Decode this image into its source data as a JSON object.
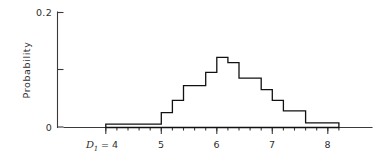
{
  "chart_data": {
    "type": "bar",
    "title": "",
    "subtitle": "",
    "xlabel": "D1",
    "ylabel": "Probability",
    "x_axis_prefix_label": "D1 = 4",
    "xlim": [
      3.9,
      8.45
    ],
    "ylim": [
      0,
      0.2
    ],
    "grid": false,
    "legend": null,
    "bin_width": 0.2,
    "x_tick_labels": [
      "4",
      "5",
      "6",
      "7",
      "8"
    ],
    "x_tick_values": [
      4,
      5,
      6,
      7,
      8
    ],
    "x_minor_tick_step": 0.2,
    "y_tick_labels": [
      "0",
      "0.2"
    ],
    "y_tick_values": [
      0,
      0.2
    ],
    "y_minor_tick_values": [
      0.1
    ],
    "categories": [
      "4.0-4.2",
      "4.2-4.4",
      "4.4-4.6",
      "4.6-4.8",
      "4.8-5.0",
      "5.0-5.2",
      "5.2-5.4",
      "5.4-5.6",
      "5.6-5.8",
      "5.8-6.0",
      "6.0-6.2",
      "6.2-6.4",
      "6.4-6.6",
      "6.6-6.8",
      "6.8-7.0",
      "7.0-7.2",
      "7.2-7.4",
      "7.4-7.6",
      "7.6-7.8",
      "7.8-8.0",
      "8.0-8.2"
    ],
    "bin_edges": [
      4.0,
      4.2,
      4.4,
      4.6,
      4.8,
      5.0,
      5.2,
      5.4,
      5.6,
      5.8,
      6.0,
      6.2,
      6.4,
      6.6,
      6.8,
      7.0,
      7.2,
      7.4,
      7.6,
      7.8,
      8.0,
      8.2
    ],
    "values": [
      0.006,
      0.006,
      0.006,
      0.006,
      0.006,
      0.026,
      0.047,
      0.073,
      0.073,
      0.096,
      0.122,
      0.113,
      0.086,
      0.086,
      0.066,
      0.047,
      0.029,
      0.029,
      0.008,
      0.008,
      0.008
    ],
    "series": [
      {
        "name": "Probability",
        "values": [
          0.006,
          0.006,
          0.006,
          0.006,
          0.006,
          0.026,
          0.047,
          0.073,
          0.073,
          0.096,
          0.122,
          0.113,
          0.086,
          0.086,
          0.066,
          0.047,
          0.029,
          0.029,
          0.008,
          0.008,
          0.008
        ]
      }
    ],
    "colors": {
      "bar_stroke": "#111111",
      "bar_fill": "#ffffff",
      "axis": "#3a3a3a",
      "text": "#2e2e2e",
      "background": "#ffffff"
    }
  },
  "axes": {
    "y_label": "Probability",
    "y_top_label": "0.2",
    "y_bottom_label": "0",
    "x_var_letter": "D",
    "x_var_subscript": "1",
    "x_var_equals": "= 4",
    "x_labels": [
      "5",
      "6",
      "7",
      "8"
    ]
  }
}
